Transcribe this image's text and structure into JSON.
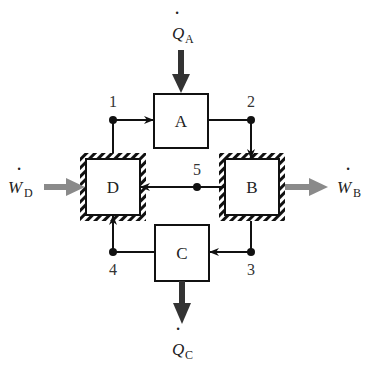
{
  "diagram": {
    "type": "thermodynamic-cycle-block-diagram",
    "components": [
      {
        "id": "A",
        "label": "A",
        "boundary": "plain"
      },
      {
        "id": "B",
        "label": "B",
        "boundary": "hatched-adiabatic"
      },
      {
        "id": "C",
        "label": "C",
        "boundary": "plain"
      },
      {
        "id": "D",
        "label": "D",
        "boundary": "hatched-adiabatic"
      }
    ],
    "nodes": [
      {
        "id": "1",
        "label": "1"
      },
      {
        "id": "2",
        "label": "2"
      },
      {
        "id": "3",
        "label": "3"
      },
      {
        "id": "4",
        "label": "4"
      },
      {
        "id": "5",
        "label": "5"
      }
    ],
    "flows": [
      {
        "from": "1",
        "to": "A"
      },
      {
        "from": "A",
        "to": "2"
      },
      {
        "from": "2",
        "to": "B"
      },
      {
        "from": "B",
        "to": "5"
      },
      {
        "from": "5",
        "to": "D"
      },
      {
        "from": "B",
        "to": "3"
      },
      {
        "from": "3",
        "to": "C"
      },
      {
        "from": "C",
        "to": "4"
      },
      {
        "from": "4",
        "to": "D"
      },
      {
        "from": "D",
        "to": "1"
      }
    ],
    "energy_transfers": [
      {
        "symbol": "Q",
        "subscript": "A",
        "direction": "in",
        "target": "A",
        "kind": "heat",
        "color": "#333333"
      },
      {
        "symbol": "Q",
        "subscript": "C",
        "direction": "out",
        "target": "C",
        "kind": "heat",
        "color": "#333333"
      },
      {
        "symbol": "W",
        "subscript": "D",
        "direction": "in",
        "target": "D",
        "kind": "work",
        "color": "#8a8a8a"
      },
      {
        "symbol": "W",
        "subscript": "B",
        "direction": "out",
        "target": "B",
        "kind": "work",
        "color": "#8a8a8a"
      }
    ]
  },
  "labels": {
    "box_a": "A",
    "box_b": "B",
    "box_c": "C",
    "box_d": "D",
    "node_1": "1",
    "node_2": "2",
    "node_3": "3",
    "node_4": "4",
    "node_5": "5",
    "qa_sym": "Q",
    "qa_sub": "A",
    "qc_sym": "Q",
    "qc_sub": "C",
    "wd_sym": "W",
    "wd_sub": "D",
    "wb_sym": "W",
    "wb_sub": "B",
    "dot": "·"
  }
}
